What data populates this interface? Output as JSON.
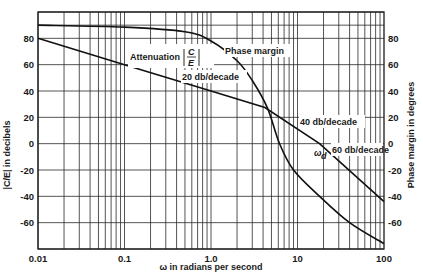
{
  "chart_data": {
    "type": "line",
    "title": "",
    "xlabel": "ω in radians per second",
    "ylabel_left": "|C/E| in decibels",
    "ylabel_right": "Phase margin in degrees",
    "xscale": "log",
    "xlim": [
      0.01,
      100
    ],
    "ylim": [
      -80,
      100
    ],
    "x_ticks": [
      "0.01",
      "0.1",
      "1.0",
      "10",
      "100"
    ],
    "y_ticks_left": [
      "80",
      "60",
      "40",
      "20",
      "0",
      "-20",
      "-40",
      "-60"
    ],
    "y_ticks_right": [
      "80",
      "60",
      "40",
      "20",
      "0",
      "-20",
      "-40",
      "-60"
    ],
    "grid": true,
    "series": [
      {
        "name": "Attenuation |C/E|",
        "x": [
          0.01,
          0.1,
          1.0,
          4.2,
          18,
          100
        ],
        "values": [
          80,
          60,
          40,
          27.5,
          0,
          -44
        ]
      },
      {
        "name": "Phase margin",
        "x": [
          0.01,
          0.1,
          0.5,
          1.0,
          2.0,
          3.0,
          4.5,
          6.2,
          9,
          18,
          40,
          100
        ],
        "values": [
          90,
          88.5,
          85,
          78,
          63,
          48,
          27,
          0,
          -20,
          -40,
          -60,
          -76
        ]
      }
    ],
    "annotations": [
      {
        "text": "Attenuation",
        "frac_num": "C",
        "frac_den": "E"
      },
      {
        "text": "Phase margin"
      },
      {
        "text": "20 db/decade"
      },
      {
        "text": "40 db/decade"
      },
      {
        "text": "60 db/decade"
      },
      {
        "text": "ω",
        "sub": "d"
      }
    ]
  }
}
